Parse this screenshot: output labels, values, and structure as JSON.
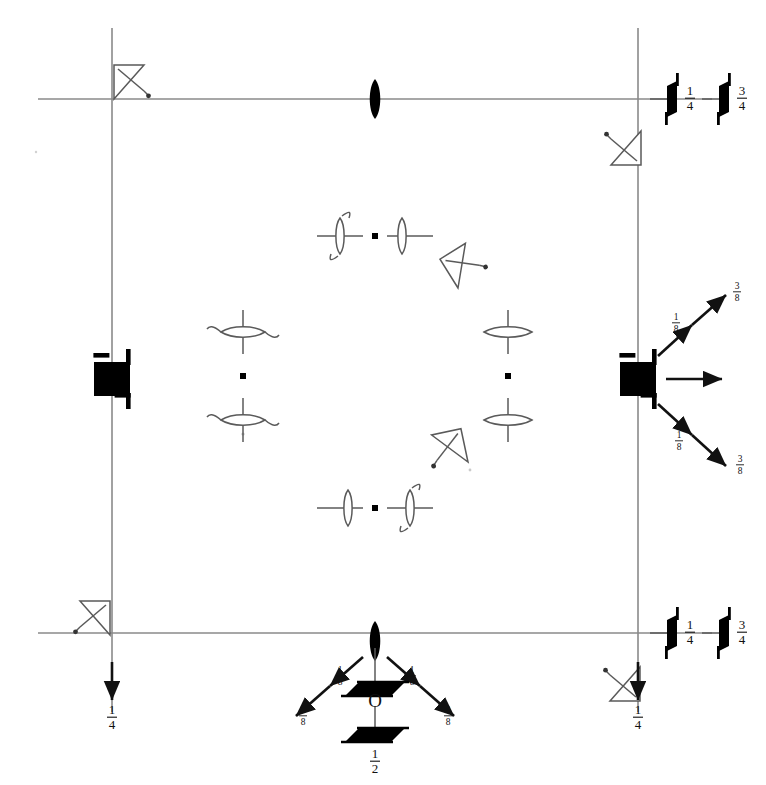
{
  "diagram": {
    "kind": "crystallographic-space-group-symmetry-diagram",
    "title": "",
    "background_color": "#ffffff",
    "line_color": "#8a8a8a",
    "symbol_color": "#000000",
    "canvas": {
      "width": 766,
      "height": 785
    },
    "unit_cell": {
      "left": 112,
      "right": 638,
      "top": 99,
      "bottom": 633,
      "axis_overhang": 74,
      "description": "square unit cell outline with axes extending past corners"
    },
    "origin_marker": {
      "label": "O",
      "height_label_numerator": "1",
      "height_label_denominator": "2",
      "height_label": "1/2"
    },
    "corner_symbols": [
      {
        "name": "roto-inversion-4-bar-top-left",
        "type": "open-triangle-with-slash",
        "x": 112,
        "y": 99,
        "corner": "top-left"
      },
      {
        "name": "roto-inversion-4-bar-top-right",
        "type": "open-triangle-with-slash",
        "x": 638,
        "y": 99,
        "corner": "top-right"
      },
      {
        "name": "roto-inversion-4-bar-bottom-left",
        "type": "open-triangle-with-slash",
        "x": 112,
        "y": 633,
        "corner": "bottom-left"
      },
      {
        "name": "roto-inversion-4-bar-bottom-right",
        "type": "open-triangle-with-slash",
        "x": 638,
        "y": 633,
        "corner": "bottom-right"
      }
    ],
    "edge_symbols": [
      {
        "name": "two-fold-axis-top-center",
        "type": "filled-lens",
        "x": 375,
        "y": 99
      },
      {
        "name": "two-fold-axis-bottom-center",
        "type": "filled-lens",
        "x": 375,
        "y": 633
      },
      {
        "name": "four-fold-axis-left-center",
        "type": "filled-square-with-tails",
        "x": 112,
        "y": 379
      },
      {
        "name": "four-fold-axis-right-center",
        "type": "filled-square-with-tails",
        "x": 638,
        "y": 379
      }
    ],
    "interior_symbols": [
      {
        "name": "two-fold-screw-axis-horizontal-top",
        "type": "lens-pair-horizontal",
        "x": 375,
        "y": 236
      },
      {
        "name": "two-fold-screw-axis-horizontal-bottom",
        "type": "lens-pair-horizontal",
        "x": 375,
        "y": 508
      },
      {
        "name": "two-fold-screw-axis-vertical-left",
        "type": "lens-pair-vertical-curved",
        "x": 243,
        "y": 376
      },
      {
        "name": "two-fold-screw-axis-vertical-right",
        "type": "lens-pair-vertical-flat",
        "x": 508,
        "y": 376
      },
      {
        "name": "roto-inversion-4-bar-upper-right",
        "type": "open-triangle-with-slash-rotated",
        "x": 456,
        "y": 270
      },
      {
        "name": "roto-inversion-4-bar-lower-right",
        "type": "open-triangle-with-slash-rotated",
        "x": 470,
        "y": 443
      }
    ],
    "glide_legend_right_top": {
      "symbols": [
        {
          "name": "glide-plane-arrow-1",
          "fraction_numerator": "1",
          "fraction_denominator": "4",
          "fraction": "1/4"
        },
        {
          "name": "glide-plane-arrow-2",
          "fraction_numerator": "3",
          "fraction_denominator": "4",
          "fraction": "3/4"
        }
      ]
    },
    "glide_legend_right_bottom": {
      "symbols": [
        {
          "name": "glide-plane-arrow-3",
          "fraction_numerator": "1",
          "fraction_denominator": "4",
          "fraction": "1/4"
        },
        {
          "name": "glide-plane-arrow-4",
          "fraction_numerator": "3",
          "fraction_denominator": "4",
          "fraction": "3/4"
        }
      ]
    },
    "height_arrows": [
      {
        "name": "down-arrow-bottom-left",
        "direction": "down",
        "numerator": "1",
        "denominator": "4",
        "fraction": "1/4",
        "x": 112,
        "y": 633
      },
      {
        "name": "down-arrow-bottom-right",
        "direction": "down",
        "numerator": "1",
        "denominator": "4",
        "fraction": "1/4",
        "x": 638,
        "y": 633
      }
    ],
    "vector_fans": [
      {
        "name": "vector-fan-right-center",
        "origin_x": 638,
        "origin_y": 379,
        "arrows": [
          {
            "name": "fan-arrow-up-inner",
            "angle_deg": -42,
            "length": 46,
            "numerator": "1",
            "denominator": "8",
            "fraction": "1/8"
          },
          {
            "name": "fan-arrow-up-outer",
            "angle_deg": -42,
            "length": 100,
            "numerator": "3",
            "denominator": "8",
            "fraction": "3/8"
          },
          {
            "name": "fan-arrow-horizontal",
            "angle_deg": 0,
            "length": 60,
            "numerator": "",
            "denominator": "",
            "fraction": ""
          },
          {
            "name": "fan-arrow-down-inner",
            "angle_deg": 42,
            "length": 46,
            "numerator": "1",
            "denominator": "8",
            "fraction": "1/8"
          },
          {
            "name": "fan-arrow-down-outer",
            "angle_deg": 42,
            "length": 100,
            "numerator": "3",
            "denominator": "8",
            "fraction": "3/8"
          }
        ]
      },
      {
        "name": "vector-fan-bottom-center",
        "origin_x": 375,
        "origin_y": 648,
        "arrows": [
          {
            "name": "fan-arrow-left-inner",
            "angle_deg": 222,
            "length": 46,
            "numerator": "1",
            "denominator": "8",
            "fraction": "1/8"
          },
          {
            "name": "fan-arrow-left-outer",
            "angle_deg": 222,
            "length": 100,
            "numerator": "3",
            "denominator": "8",
            "fraction": "3/8"
          },
          {
            "name": "fan-arrow-right-inner",
            "angle_deg": -42,
            "length": 46,
            "numerator": "1",
            "denominator": "8",
            "fraction": "1/8"
          },
          {
            "name": "fan-arrow-right-outer",
            "angle_deg": -42,
            "length": 100,
            "numerator": "3",
            "denominator": "8",
            "fraction": "3/8"
          }
        ]
      }
    ]
  }
}
